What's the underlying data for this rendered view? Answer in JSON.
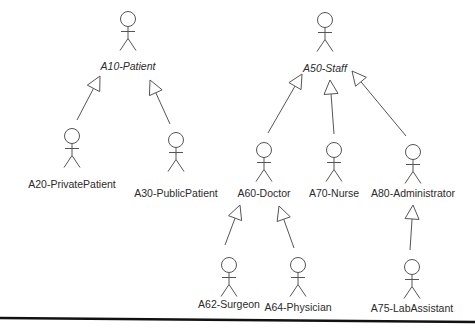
{
  "diagram": {
    "type": "uml-actor-generalization",
    "actors": [
      {
        "id": "A10",
        "label": "A10-Patient",
        "abstract": true,
        "x": 128,
        "y": 19,
        "label_y": 60
      },
      {
        "id": "A20",
        "label": "A20-PrivatePatient",
        "abstract": false,
        "x": 72,
        "y": 136,
        "label_y": 178
      },
      {
        "id": "A30",
        "label": "A30-PublicPatient",
        "abstract": false,
        "x": 176,
        "y": 140,
        "label_y": 187
      },
      {
        "id": "A50",
        "label": "A50-Staff",
        "abstract": true,
        "x": 325,
        "y": 20,
        "label_y": 62
      },
      {
        "id": "A60",
        "label": "A60-Doctor",
        "abstract": false,
        "x": 264,
        "y": 150,
        "label_y": 187
      },
      {
        "id": "A70",
        "label": "A70-Nurse",
        "abstract": false,
        "x": 334,
        "y": 150,
        "label_y": 187
      },
      {
        "id": "A80",
        "label": "A80-Administrator",
        "abstract": false,
        "x": 413,
        "y": 152,
        "label_y": 187
      },
      {
        "id": "A62",
        "label": "A62-Surgeon",
        "abstract": false,
        "x": 229,
        "y": 265,
        "label_y": 298
      },
      {
        "id": "A64",
        "label": "A64-Physician",
        "abstract": false,
        "x": 298,
        "y": 265,
        "label_y": 301
      },
      {
        "id": "A75",
        "label": "A75-LabAssistant",
        "abstract": false,
        "x": 412,
        "y": 267,
        "label_y": 302
      }
    ],
    "generalizations": [
      {
        "child": "A20",
        "parent": "A10",
        "from": [
          77,
          120
        ],
        "to": [
          100,
          76
        ]
      },
      {
        "child": "A30",
        "parent": "A10",
        "from": [
          170,
          124
        ],
        "to": [
          150,
          80
        ]
      },
      {
        "child": "A60",
        "parent": "A50",
        "from": [
          268,
          133
        ],
        "to": [
          302,
          74
        ]
      },
      {
        "child": "A70",
        "parent": "A50",
        "from": [
          334,
          134
        ],
        "to": [
          330,
          80
        ]
      },
      {
        "child": "A80",
        "parent": "A50",
        "from": [
          406,
          136
        ],
        "to": [
          352,
          71
        ]
      },
      {
        "child": "A62",
        "parent": "A60",
        "from": [
          225,
          245
        ],
        "to": [
          240,
          205
        ]
      },
      {
        "child": "A64",
        "parent": "A60",
        "from": [
          294,
          248
        ],
        "to": [
          279,
          206
        ]
      },
      {
        "child": "A75",
        "parent": "A80",
        "from": [
          410,
          250
        ],
        "to": [
          413,
          205
        ]
      }
    ],
    "line_color": "#555555",
    "text_color": "#2b2b2b"
  }
}
